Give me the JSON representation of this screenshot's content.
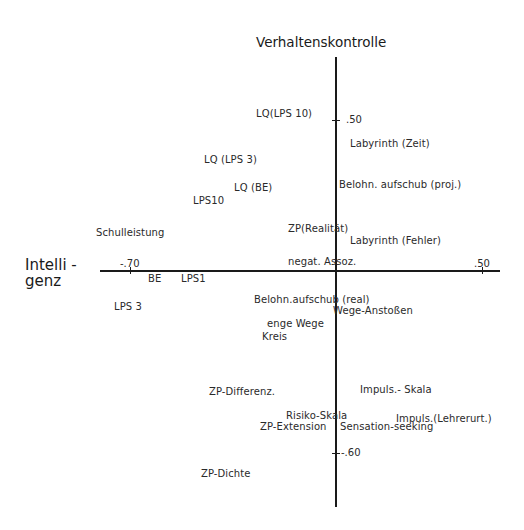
{
  "diagram": {
    "vertical_axis_title": "Verhaltenskontrolle",
    "horizontal_axis_title_line1": "Intelli -",
    "horizontal_axis_title_line2": "genz",
    "ticks": {
      "v_pos": ".50",
      "v_neg": "-.60",
      "h_neg": "-.70",
      "h_pos": ".50"
    },
    "center_label": "negat. Assoz.",
    "points": [
      {
        "label": "LQ(LPS 10)",
        "x": 256,
        "y": 109
      },
      {
        "label": "Labyrinth (Zeit)",
        "x": 350,
        "y": 139
      },
      {
        "label": "LQ (LPS 3)",
        "x": 204,
        "y": 155
      },
      {
        "label": "LQ (BE)",
        "x": 234,
        "y": 183
      },
      {
        "label": "Belohn. aufschub (proj.)",
        "x": 339,
        "y": 180
      },
      {
        "label": "LPS10",
        "x": 193,
        "y": 196
      },
      {
        "label": "Schulleistung",
        "x": 96,
        "y": 228
      },
      {
        "label": "ZP(Realität)",
        "x": 288,
        "y": 224
      },
      {
        "label": "Labyrinth (Fehler)",
        "x": 350,
        "y": 236
      },
      {
        "label": "BE",
        "x": 148,
        "y": 274
      },
      {
        "label": "LPS1",
        "x": 181,
        "y": 274
      },
      {
        "label": "LPS 3",
        "x": 114,
        "y": 302
      },
      {
        "label": "Belohn.aufschub (real)",
        "x": 254,
        "y": 295
      },
      {
        "label": "Wege-Anstoßen",
        "x": 333,
        "y": 306
      },
      {
        "label": "enge Wege",
        "x": 267,
        "y": 319
      },
      {
        "label": "Kreis",
        "x": 262,
        "y": 332
      },
      {
        "label": "ZP-Differenz.",
        "x": 209,
        "y": 387
      },
      {
        "label": "Impuls.- Skala",
        "x": 360,
        "y": 385
      },
      {
        "label": "Risiko-Skala",
        "x": 286,
        "y": 411
      },
      {
        "label": "Impuls.(Lehrerurt.)",
        "x": 396,
        "y": 414
      },
      {
        "label": "ZP-Extension",
        "x": 260,
        "y": 422
      },
      {
        "label": "Sensation-seeking",
        "x": 340,
        "y": 422
      },
      {
        "label": "ZP-Dichte",
        "x": 201,
        "y": 469
      }
    ]
  }
}
